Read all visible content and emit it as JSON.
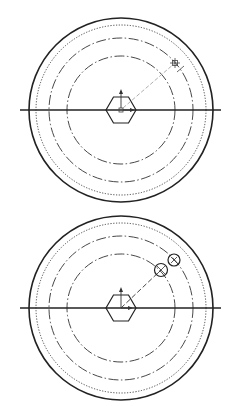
{
  "drawings": [
    {
      "id": "top-view",
      "center": [
        121,
        110
      ],
      "outer_radius": 92,
      "rings": [
        {
          "r": 92,
          "style": "solid"
        },
        {
          "r": 85,
          "style": "dotted"
        },
        {
          "r": 72,
          "style": "dashdot"
        },
        {
          "r": 54,
          "style": "dashdot"
        }
      ],
      "axis_line": {
        "x1": 20,
        "x2": 221
      },
      "hexagon_radius": 15,
      "marker": {
        "type": "small-cross-square",
        "x": 175,
        "y": 63
      },
      "leader_to": [
        175,
        63
      ]
    },
    {
      "id": "bottom-view",
      "center": [
        121,
        308
      ],
      "outer_radius": 92,
      "rings": [
        {
          "r": 92,
          "style": "solid"
        },
        {
          "r": 85,
          "style": "dotted"
        },
        {
          "r": 72,
          "style": "dashdot"
        },
        {
          "r": 54,
          "style": "dashdot"
        }
      ],
      "axis_line": {
        "x1": 20,
        "x2": 221
      },
      "hexagon_radius": 15,
      "holes": [
        {
          "x": 161,
          "y": 270,
          "r": 6.5
        },
        {
          "x": 174,
          "y": 260,
          "r": 6
        }
      ],
      "leader_to": [
        161,
        270
      ]
    }
  ]
}
